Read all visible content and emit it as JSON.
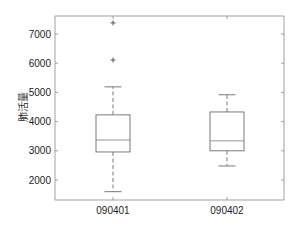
{
  "chart_data": {
    "type": "box",
    "title": "",
    "xlabel": "",
    "ylabel": "肺活量",
    "ylim": [
      1350,
      7620
    ],
    "yticks": [
      2000,
      3000,
      4000,
      5000,
      6000,
      7000
    ],
    "grid": false,
    "legend": null,
    "categories": [
      "090401",
      "090402"
    ],
    "boxes": [
      {
        "name": "090401",
        "whisker_low": 1600,
        "q1": 2960,
        "median": 3370,
        "q3": 4230,
        "whisker_high": 5190,
        "outliers": [
          6110,
          7380
        ]
      },
      {
        "name": "090402",
        "whisker_low": 2480,
        "q1": 3000,
        "median": 3340,
        "q3": 4330,
        "whisker_high": 4920,
        "outliers": []
      }
    ]
  },
  "style": {
    "box_color": "#6b6b6b",
    "axis_color": "#8a8a8a",
    "median_color": "#8a8a8a"
  }
}
